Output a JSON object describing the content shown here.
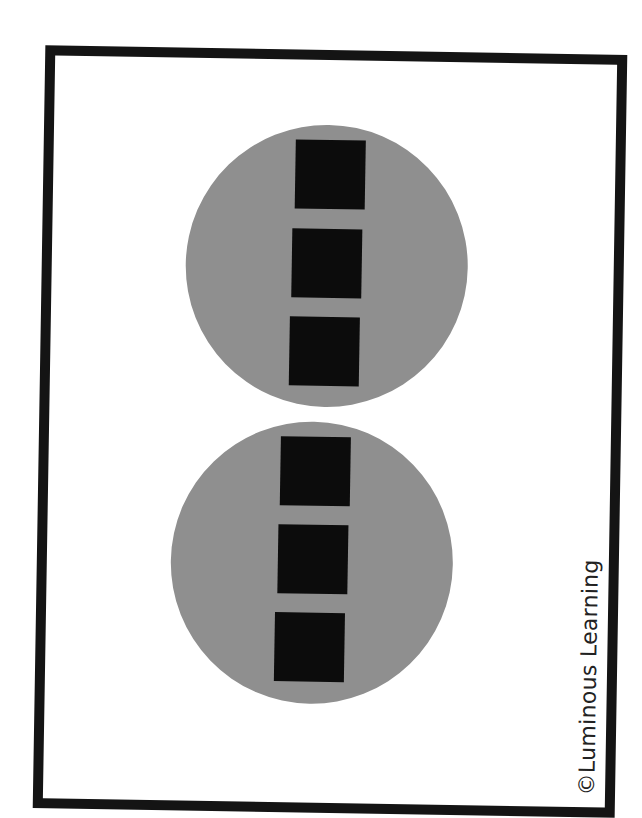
{
  "card": {
    "credit_text": "©Luminous Learning"
  },
  "figures": [
    {
      "name": "top-circle",
      "squares": 3
    },
    {
      "name": "bottom-circle",
      "squares": 3
    }
  ],
  "colors": {
    "frame": "#141414",
    "circle": "#8f8f8f",
    "square": "#0c0c0c",
    "background": "#ffffff"
  }
}
